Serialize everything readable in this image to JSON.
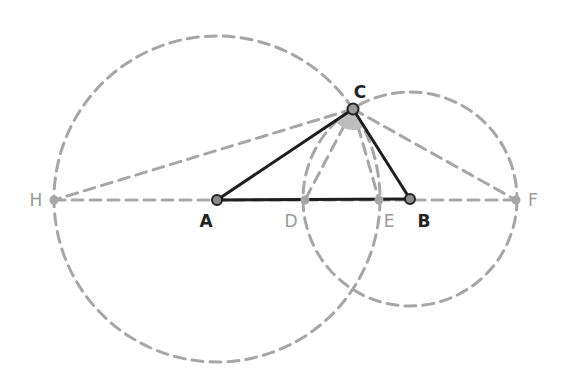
{
  "diagram": {
    "type": "geometry-construction",
    "colors": {
      "construction": "#a6a6a6",
      "segment": "#1e1e1e",
      "point_main_fill": "#8c8c8c",
      "point_main_stroke": "#222222",
      "point_aux_fill": "#a6a6a6",
      "angle_fill": "#bdbdbd",
      "label_main": "#222222",
      "label_aux": "#9a9a9a"
    },
    "points": [
      {
        "id": "A",
        "label": "A",
        "x": 217,
        "y": 200,
        "main": true,
        "lx": 206,
        "ly": 227
      },
      {
        "id": "B",
        "label": "B",
        "x": 410,
        "y": 199,
        "main": true,
        "lx": 424,
        "ly": 227
      },
      {
        "id": "C",
        "label": "C",
        "x": 353,
        "y": 109,
        "main": true,
        "lx": 360,
        "ly": 98
      },
      {
        "id": "D",
        "label": "D",
        "x": 305,
        "y": 200,
        "main": false,
        "lx": 291,
        "ly": 227
      },
      {
        "id": "E",
        "label": "E",
        "x": 379,
        "y": 200,
        "main": false,
        "lx": 389,
        "ly": 227
      },
      {
        "id": "F",
        "label": "F",
        "x": 516,
        "y": 200,
        "main": false,
        "lx": 533,
        "ly": 206
      },
      {
        "id": "H",
        "label": "H",
        "x": 54,
        "y": 200,
        "main": false,
        "lx": 36,
        "ly": 206
      }
    ],
    "circles": [
      {
        "id": "circle-A",
        "center": "A",
        "cx": 217,
        "cy": 199,
        "r": 163
      },
      {
        "id": "circle-B",
        "center": "B",
        "cx": 410,
        "cy": 199,
        "r": 107
      }
    ],
    "dashed_lines": [
      {
        "from": "H",
        "to": "F"
      },
      {
        "from": "C",
        "to": "H"
      },
      {
        "from": "C",
        "to": "F"
      },
      {
        "from": "C",
        "to": "D"
      },
      {
        "from": "C",
        "to": "E"
      }
    ],
    "solid_segments": [
      {
        "from": "A",
        "to": "B"
      },
      {
        "from": "A",
        "to": "C"
      },
      {
        "from": "C",
        "to": "B"
      }
    ],
    "angle_mark": {
      "vertex": "C",
      "from": "A",
      "to": "B",
      "r": 21
    }
  }
}
